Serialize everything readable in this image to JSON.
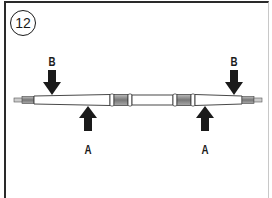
{
  "figure": {
    "step_number": "12",
    "labels": {
      "left_b": "B",
      "right_b": "B",
      "left_a": "A",
      "right_a": "A"
    },
    "arrows": [
      {
        "id": "left-b",
        "label": "B",
        "direction": "down"
      },
      {
        "id": "left-a",
        "label": "A",
        "direction": "up"
      },
      {
        "id": "right-a",
        "label": "A",
        "direction": "up"
      },
      {
        "id": "right-b",
        "label": "B",
        "direction": "down"
      }
    ],
    "colors": {
      "ink": "#1a1a1a",
      "collar": "#8a8a8a",
      "rod": "#ffffff"
    }
  }
}
